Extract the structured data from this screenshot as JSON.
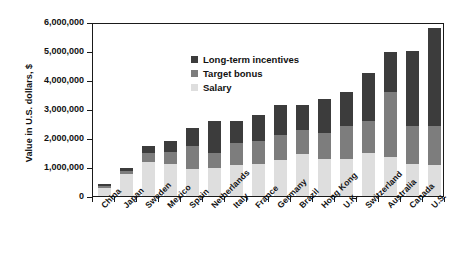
{
  "chart_data": {
    "type": "bar",
    "stacked": true,
    "title": "",
    "subtitle": "",
    "xlabel": "",
    "ylabel": "Value in U.S. dollars, $",
    "ylim": [
      0,
      6000000
    ],
    "ytick_values": [
      0,
      1000000,
      2000000,
      3000000,
      4000000,
      5000000,
      6000000
    ],
    "ytick_labels": [
      "0",
      "1,000,000",
      "2,000,000",
      "3,000,000",
      "4,000,000",
      "5,000,000",
      "6,000,000"
    ],
    "grid": false,
    "legend_position": "top-left",
    "categories": [
      "China",
      "Japan",
      "Sweden",
      "Mexico",
      "Spain",
      "Netherlands",
      "Italy",
      "France",
      "Germany",
      "Brazil",
      "Hong Kong",
      "U.K.",
      "Switzerland",
      "Australia",
      "Canada",
      "U.S."
    ],
    "series": [
      {
        "name": "Salary",
        "color": "#dedede",
        "values": [
          280000,
          760000,
          1180000,
          1110000,
          940000,
          950000,
          1060000,
          1110000,
          1250000,
          1440000,
          1280000,
          1260000,
          1490000,
          1340000,
          1090000,
          1060000
        ]
      },
      {
        "name": "Target bonus",
        "color": "#7d7d7d",
        "values": [
          60000,
          100000,
          290000,
          420000,
          800000,
          530000,
          760000,
          770000,
          860000,
          840000,
          900000,
          1170000,
          1080000,
          2230000,
          1320000,
          1340000
        ]
      },
      {
        "name": "Long-term incentives",
        "color": "#3c3c3c",
        "values": [
          70000,
          120000,
          270000,
          370000,
          590000,
          1090000,
          760000,
          900000,
          1030000,
          870000,
          1150000,
          1170000,
          1660000,
          1380000,
          2590000,
          3380000
        ]
      }
    ],
    "totals": [
      410000,
      980000,
      1740000,
      1900000,
      2330000,
      2570000,
      2580000,
      2780000,
      3140000,
      3150000,
      3330000,
      3600000,
      4230000,
      4950000,
      5000000,
      5780000
    ]
  },
  "legend": {
    "items": [
      {
        "label": "Long-term incentives",
        "color": "#3c3c3c"
      },
      {
        "label": "Target bonus",
        "color": "#7d7d7d"
      },
      {
        "label": "Salary",
        "color": "#dedede"
      }
    ]
  },
  "axis": {
    "y_title": "Value in U.S. dollars, $"
  },
  "colors": {
    "axis": "#1a1a1a",
    "background": "#ffffff",
    "salary": "#dedede",
    "target_bonus": "#7d7d7d",
    "long_term_incentives": "#3c3c3c"
  }
}
